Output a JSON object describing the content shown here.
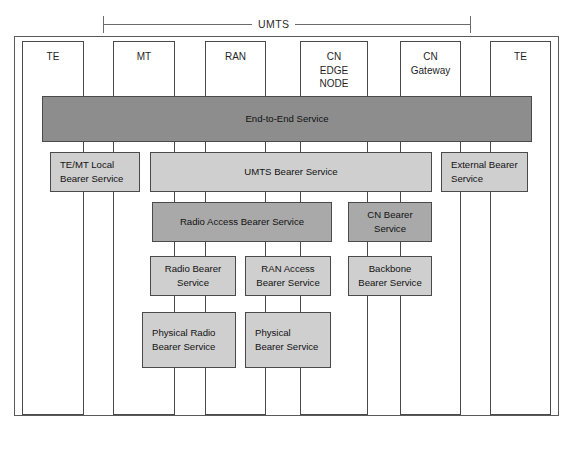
{
  "figure": {
    "span_label": "UMTS",
    "caption": ""
  },
  "columns": [
    {
      "id": "te-left",
      "label": "TE"
    },
    {
      "id": "mt",
      "label": "MT"
    },
    {
      "id": "ran",
      "label": "RAN"
    },
    {
      "id": "cn-edge",
      "label": "CN\nEDGE\nNODE"
    },
    {
      "id": "cn-gateway",
      "label": "CN\nGateway"
    },
    {
      "id": "te-right",
      "label": "TE"
    }
  ],
  "layers": {
    "end_to_end": {
      "label": "End-to-End Service",
      "shade": "dark"
    },
    "row_bearer": [
      {
        "id": "te-mt-local",
        "label": "TE/MT Local\nBearer Service",
        "shade": "light",
        "align": "left"
      },
      {
        "id": "umts-bearer",
        "label": "UMTS Bearer Service",
        "shade": "light",
        "align": "center"
      },
      {
        "id": "external",
        "label": "External Bearer\nService",
        "shade": "light",
        "align": "left"
      }
    ],
    "row_access": [
      {
        "id": "radio-access-bearer",
        "label": "Radio Access Bearer Service",
        "shade": "mid",
        "align": "center"
      },
      {
        "id": "cn-bearer",
        "label": "CN Bearer\nService",
        "shade": "mid",
        "align": "center"
      }
    ],
    "row_link": [
      {
        "id": "radio-bearer",
        "label": "Radio Bearer\nService",
        "shade": "light",
        "align": "center"
      },
      {
        "id": "ran-access",
        "label": "RAN Access\nBearer Service",
        "shade": "light",
        "align": "center"
      },
      {
        "id": "backbone-bearer",
        "label": "Backbone\nBearer Service",
        "shade": "light",
        "align": "center"
      }
    ],
    "row_physical": [
      {
        "id": "physical-radio",
        "label": "Physical Radio\nBearer Service",
        "shade": "light",
        "align": "left"
      },
      {
        "id": "physical-bearer",
        "label": "Physical\nBearer Service",
        "shade": "light",
        "align": "left"
      }
    ]
  },
  "colors": {
    "dark_gray": "#8d8d8d",
    "mid_gray": "#a9a9a9",
    "light_gray": "#cfcfcf",
    "stroke": "#4a4a4a",
    "background": "#ffffff"
  }
}
